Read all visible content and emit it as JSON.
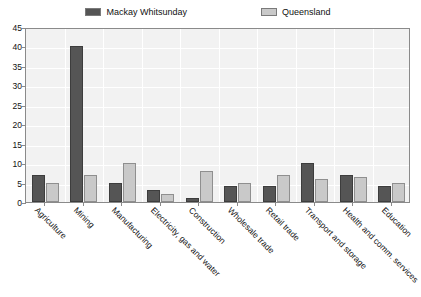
{
  "chart_data": {
    "type": "bar",
    "title": "",
    "xlabel": "",
    "ylabel": "",
    "ylim": [
      0,
      45
    ],
    "ytick_step": 5,
    "yticks": [
      0,
      5,
      10,
      15,
      20,
      25,
      30,
      35,
      40,
      45
    ],
    "grid": true,
    "legend_position": "top",
    "categories": [
      "Agriculture",
      "Mining",
      "Manufacturing",
      "Electricity, gas and water",
      "Construction",
      "Wholesale trade",
      "Retail trade",
      "Transport and storage",
      "Health and comm. services",
      "Education"
    ],
    "series": [
      {
        "name": "Mackay Whitsunday",
        "color": "#555555",
        "values": [
          7,
          40,
          5,
          3,
          1,
          4,
          4,
          10,
          7,
          4
        ]
      },
      {
        "name": "Queensland",
        "color": "#c9c9c9",
        "values": [
          5,
          7,
          10,
          2,
          8,
          5,
          7,
          6,
          6.5,
          5
        ]
      }
    ]
  },
  "legend": {
    "entries": [
      {
        "label": "Mackay Whitsunday",
        "swatch": "legend-swatch-mackay-whitsunday"
      },
      {
        "label": "Queensland",
        "swatch": "legend-swatch-queensland"
      }
    ]
  }
}
